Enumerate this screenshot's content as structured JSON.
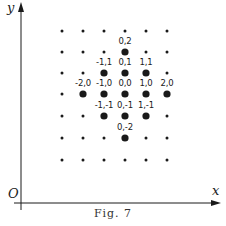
{
  "figure": {
    "caption": "Fig. 7",
    "axes": {
      "x_label": "x",
      "y_label": "y",
      "origin_label": "O"
    },
    "grid": {
      "columns_px": [
        62,
        83,
        104,
        125,
        146,
        167
      ],
      "rows_px": [
        31,
        52,
        73,
        94,
        116,
        138,
        160
      ],
      "center_col": 3,
      "center_row": 3
    },
    "highlighted_points": [
      {
        "label": "0,2",
        "dx": 0,
        "dy": 2
      },
      {
        "label": "-1,1",
        "dx": -1,
        "dy": 1
      },
      {
        "label": "0,1",
        "dx": 0,
        "dy": 1
      },
      {
        "label": "1,1",
        "dx": 1,
        "dy": 1
      },
      {
        "label": "-2,0",
        "dx": -2,
        "dy": 0
      },
      {
        "label": "-1,0",
        "dx": -1,
        "dy": 0
      },
      {
        "label": "0,0",
        "dx": 0,
        "dy": 0
      },
      {
        "label": "1,0",
        "dx": 1,
        "dy": 0
      },
      {
        "label": "2,0",
        "dx": 2,
        "dy": 0
      },
      {
        "label": "-1,-1",
        "dx": -1,
        "dy": -1
      },
      {
        "label": "0,-1",
        "dx": 0,
        "dy": -1
      },
      {
        "label": "1,-1",
        "dx": 1,
        "dy": -1
      },
      {
        "label": "0,-2",
        "dx": 0,
        "dy": -2
      }
    ],
    "colors": {
      "ink": "#1a1a1a",
      "background": "#ffffff"
    }
  }
}
